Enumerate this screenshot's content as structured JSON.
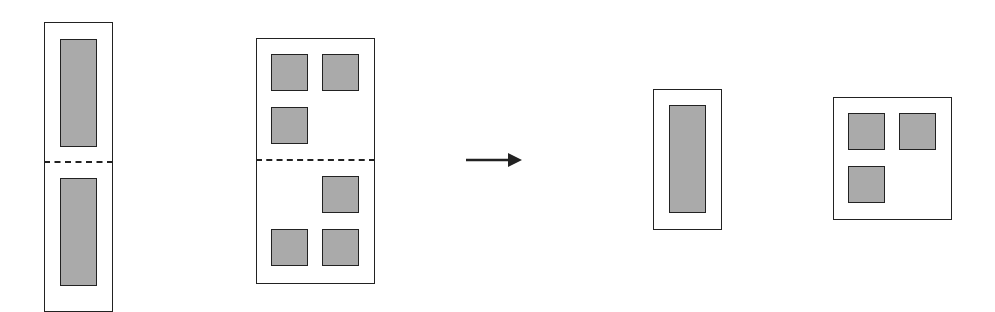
{
  "diagram": {
    "colors": {
      "outline": "#222222",
      "block_fill": "#aaaaaa",
      "background": "#ffffff"
    },
    "before": [
      {
        "id": "tall-container",
        "frame": {
          "x": 44,
          "y": 22,
          "w": 69,
          "h": 290
        },
        "divider_y": 162,
        "blocks": [
          {
            "x": 60,
            "y": 39,
            "w": 37,
            "h": 108
          },
          {
            "x": 60,
            "y": 178,
            "w": 37,
            "h": 108
          }
        ]
      },
      {
        "id": "square-container",
        "frame": {
          "x": 256,
          "y": 38,
          "w": 119,
          "h": 246
        },
        "divider_y": 160,
        "blocks": [
          {
            "x": 271,
            "y": 54,
            "w": 37,
            "h": 37
          },
          {
            "x": 322,
            "y": 54,
            "w": 37,
            "h": 37
          },
          {
            "x": 271,
            "y": 107,
            "w": 37,
            "h": 37
          },
          {
            "x": 322,
            "y": 176,
            "w": 37,
            "h": 37
          },
          {
            "x": 271,
            "y": 229,
            "w": 37,
            "h": 37
          },
          {
            "x": 322,
            "y": 229,
            "w": 37,
            "h": 37
          }
        ]
      }
    ],
    "arrow": {
      "x1": 466,
      "y": 160,
      "x2": 522,
      "direction": "right"
    },
    "after": [
      {
        "id": "compact-tall-container",
        "frame": {
          "x": 653,
          "y": 89,
          "w": 69,
          "h": 141
        },
        "blocks": [
          {
            "x": 669,
            "y": 105,
            "w": 37,
            "h": 108
          }
        ]
      },
      {
        "id": "compact-square-container",
        "frame": {
          "x": 833,
          "y": 97,
          "w": 119,
          "h": 123
        },
        "blocks": [
          {
            "x": 848,
            "y": 113,
            "w": 37,
            "h": 37
          },
          {
            "x": 899,
            "y": 113,
            "w": 37,
            "h": 37
          },
          {
            "x": 848,
            "y": 166,
            "w": 37,
            "h": 37
          }
        ]
      }
    ]
  }
}
